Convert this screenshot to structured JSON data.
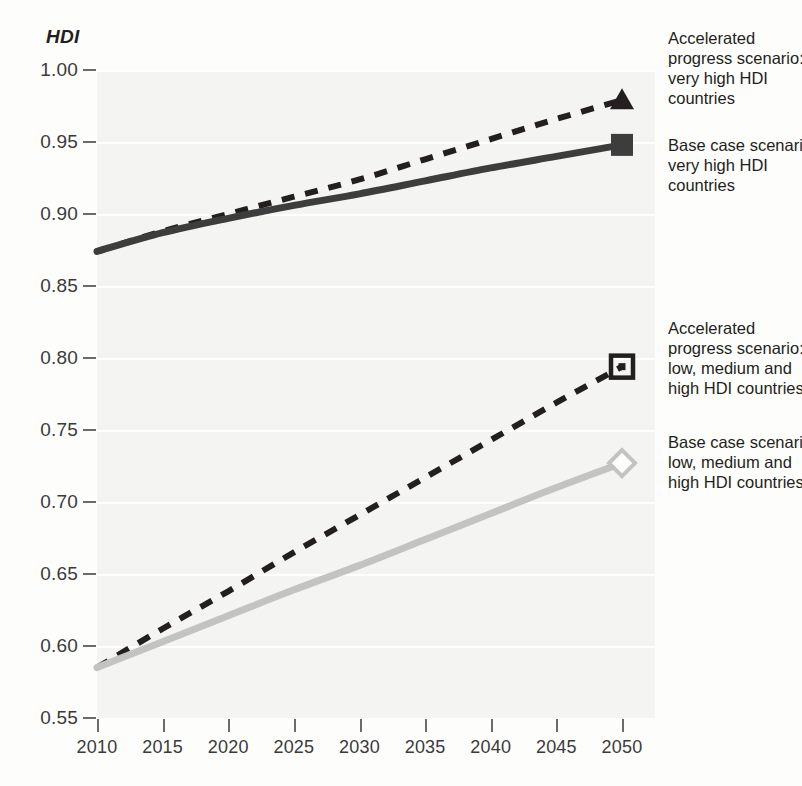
{
  "chart_data": {
    "type": "line",
    "title": "",
    "xlabel": "",
    "ylabel": "HDI",
    "xlim": [
      2010,
      2050
    ],
    "ylim": [
      0.55,
      1.0
    ],
    "grid": true,
    "legend_position": "right",
    "x_ticks": [
      2010,
      2015,
      2020,
      2025,
      2030,
      2035,
      2040,
      2045,
      2050
    ],
    "x_tick_labels": [
      "2010",
      "2015",
      "2020",
      "2025",
      "2030",
      "2035",
      "2040",
      "2045",
      "2050"
    ],
    "y_ticks": [
      0.55,
      0.6,
      0.65,
      0.7,
      0.75,
      0.8,
      0.85,
      0.9,
      0.95,
      1.0
    ],
    "y_tick_labels": [
      "0.55",
      "0.60",
      "0.65",
      "0.70",
      "0.75",
      "0.80",
      "0.85",
      "0.90",
      "0.95",
      "1.00"
    ],
    "series": [
      {
        "name": "Accelerated progress scenario: very high HDI countries",
        "style": "dashed",
        "color": "#231f20",
        "marker": "triangle-filled",
        "x": [
          2010,
          2015,
          2020,
          2025,
          2030,
          2035,
          2040,
          2045,
          2050
        ],
        "values": [
          0.874,
          0.888,
          0.9,
          0.912,
          0.924,
          0.938,
          0.952,
          0.966,
          0.979
        ]
      },
      {
        "name": "Base case scenario: very high HDI countries",
        "style": "solid",
        "color": "#3d3d3d",
        "marker": "square-filled",
        "x": [
          2010,
          2015,
          2020,
          2025,
          2030,
          2035,
          2040,
          2045,
          2050
        ],
        "values": [
          0.874,
          0.887,
          0.897,
          0.906,
          0.914,
          0.923,
          0.932,
          0.94,
          0.948
        ]
      },
      {
        "name": "Accelerated progress scenario: low, medium and high HDI countries",
        "style": "dashed",
        "color": "#231f20",
        "marker": "square-outline-dot",
        "x": [
          2010,
          2015,
          2020,
          2025,
          2030,
          2035,
          2040,
          2045,
          2050
        ],
        "values": [
          0.585,
          0.612,
          0.638,
          0.665,
          0.691,
          0.717,
          0.743,
          0.769,
          0.794
        ]
      },
      {
        "name": "Base case scenario: low, medium and high HDI countries",
        "style": "solid",
        "color": "#c3c3c3",
        "marker": "diamond-outline",
        "x": [
          2010,
          2015,
          2020,
          2025,
          2030,
          2035,
          2040,
          2045,
          2050
        ],
        "values": [
          0.585,
          0.603,
          0.621,
          0.639,
          0.656,
          0.674,
          0.692,
          0.71,
          0.727
        ]
      }
    ]
  },
  "legend": {
    "entries": [
      {
        "lines": [
          "Accelerated",
          "progress scenario:",
          "very high HDI",
          "countries"
        ],
        "marker": "triangle-filled"
      },
      {
        "lines": [
          "Base case scenario:",
          "very high HDI",
          "countries"
        ],
        "marker": "square-filled"
      },
      {
        "lines": [
          "Accelerated",
          "progress scenario:",
          "low, medium and",
          "high HDI countries"
        ],
        "marker": "square-outline-dot"
      },
      {
        "lines": [
          "Base case scenario:",
          "low, medium and",
          "high HDI countries"
        ],
        "marker": "diamond-outline"
      }
    ]
  },
  "colors": {
    "dark": "#231f20",
    "solid_dark_line": "#3d3d3d",
    "light_gray_line": "#c3c3c3",
    "plot_background": "#f4f4f2",
    "gridline": "#ffffff",
    "tick": "#6b6b6b",
    "text": "#3b3b3b"
  }
}
